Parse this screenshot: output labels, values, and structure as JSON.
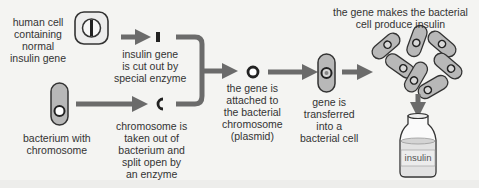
{
  "diagram": {
    "colors": {
      "arrow": "#6b6b6b",
      "cell_fill": "#b8b8b8",
      "cell_outline": "#3a3a3a",
      "human_cell_fill": "#e6e6e6",
      "background": "#f4f4f2"
    },
    "labels": {
      "human_cell": [
        "human cell",
        "containing",
        "normal",
        "insulin gene"
      ],
      "bacterium": [
        "bacterium with",
        "chromosome"
      ],
      "insulin_gene_cut": [
        "insulin gene",
        "is cut out by",
        "special enzyme"
      ],
      "chromosome_split": [
        "chromosome is",
        "taken out of",
        "bacterium and",
        "split open by",
        "an enzyme"
      ],
      "gene_attached": [
        "the gene is",
        "attached to",
        "the bacterial",
        "chromosome",
        "(plasmid)"
      ],
      "gene_transferred": [
        "gene is",
        "transferred",
        "into a",
        "bacterial cell"
      ],
      "produce_insulin": [
        "the gene makes the bacterial",
        "cell produce insulin"
      ],
      "bottle": "insulin"
    },
    "icons": {
      "human_cell": "human-cell-icon",
      "bacterium": "bacterium-icon",
      "gene_fragment": "gene-fragment-icon",
      "open_chromosome": "open-chromosome-icon",
      "plasmid": "plasmid-icon",
      "transformed_bacterium": "transformed-bacterium-icon",
      "bacteria_colony": "bacteria-colony-icon",
      "insulin_bottle": "insulin-bottle-icon"
    }
  }
}
